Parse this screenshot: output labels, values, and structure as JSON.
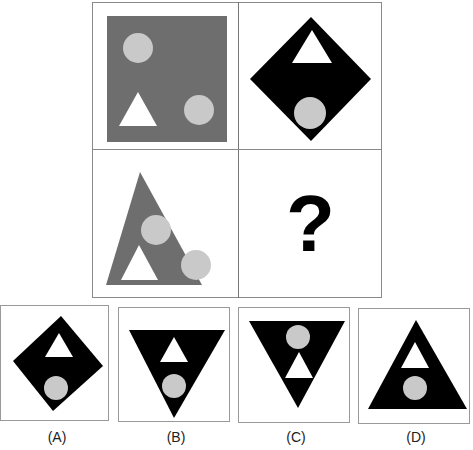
{
  "puzzle": {
    "question_mark": "?",
    "colors": {
      "dark_gray": "#6e6e6e",
      "black": "#000000",
      "light_circle": "#c9c9c9",
      "white": "#ffffff",
      "border": "#8a8a8a"
    },
    "grid_cells": [
      {
        "position": "top-left",
        "shape": "square",
        "fill": "dark-gray",
        "contents": [
          "circle",
          "triangle",
          "circle"
        ]
      },
      {
        "position": "top-right",
        "shape": "diamond",
        "fill": "black",
        "contents": [
          "triangle",
          "circle"
        ]
      },
      {
        "position": "bottom-left",
        "shape": "triangle",
        "fill": "dark-gray",
        "contents": [
          "circle",
          "triangle",
          "circle"
        ]
      },
      {
        "position": "bottom-right",
        "shape": "unknown",
        "contents": [
          "?"
        ]
      }
    ],
    "options": [
      {
        "label": "(A)",
        "shape": "diamond"
      },
      {
        "label": "(B)",
        "shape": "inverted-triangle"
      },
      {
        "label": "(C)",
        "shape": "inverted-triangle"
      },
      {
        "label": "(D)",
        "shape": "triangle"
      }
    ]
  }
}
